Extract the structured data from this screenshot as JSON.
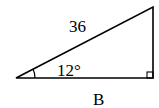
{
  "diagram": {
    "type": "right-triangle",
    "hypotenuse_label": "36",
    "angle_label": "12°",
    "base_label": "B",
    "right_angle_marker": true,
    "stroke_color": "#000000",
    "background": "#ffffff"
  }
}
